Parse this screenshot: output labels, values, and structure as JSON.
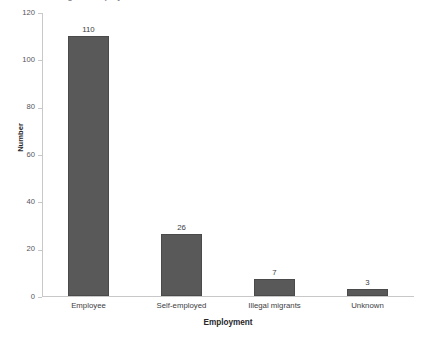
{
  "chart_data": {
    "type": "bar",
    "title": "",
    "title_fragment": "Figure: Employment status",
    "xlabel": "Employment",
    "ylabel": "Number",
    "categories": [
      "Employee",
      "Self-employed",
      "Illegal migrants",
      "Unknown"
    ],
    "values": [
      110,
      26,
      7,
      3
    ],
    "value_labels": [
      "110",
      "26",
      "7",
      "3"
    ],
    "ylim": [
      0,
      120
    ],
    "yticks": [
      0,
      20,
      40,
      60,
      80,
      100,
      120
    ],
    "ytick_labels": [
      "0",
      "20",
      "40",
      "60",
      "80",
      "100",
      "120"
    ],
    "grid": false,
    "legend": false,
    "bar_color": "#595959",
    "bar_edge_color": "#4a4a4a",
    "axis_color": "#c8c8c8",
    "text_color": "#3d3d42",
    "background": "#ffffff"
  }
}
